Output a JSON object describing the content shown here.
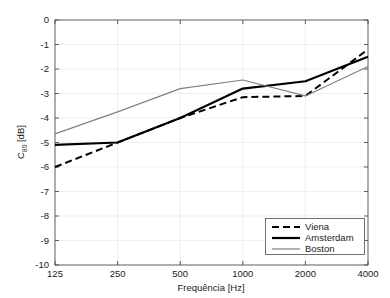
{
  "chart_data": {
    "type": "line",
    "title": "",
    "xlabel": "Frequência [Hz]",
    "ylabel": "C80 [dB]",
    "ylabel_base": "C",
    "ylabel_sub": "80",
    "ylabel_unit": " [dB]",
    "categories": [
      "125",
      "250",
      "500",
      "1000",
      "2000",
      "4000"
    ],
    "x_tick_labels": [
      "125",
      "250",
      "500",
      "1000",
      "2000",
      "4000"
    ],
    "y_tick_labels": [
      "0",
      "-1",
      "-2",
      "-3",
      "-4",
      "-5",
      "-6",
      "-7",
      "-8",
      "-9",
      "-10"
    ],
    "y_tick_values": [
      0,
      -1,
      -2,
      -3,
      -4,
      -5,
      -6,
      -7,
      -8,
      -9,
      -10
    ],
    "ylim": [
      -10,
      0
    ],
    "xscale": "log",
    "grid": true,
    "legend_position": "lower right",
    "series": [
      {
        "name": "Viena",
        "style": "dashed",
        "color": "#000000",
        "width": 2.0,
        "values": [
          -6.0,
          -5.0,
          -4.0,
          -3.15,
          -3.1,
          -1.2
        ]
      },
      {
        "name": "Amsterdam",
        "style": "solid",
        "color": "#000000",
        "width": 2.2,
        "values": [
          -5.1,
          -5.0,
          -4.0,
          -2.8,
          -2.5,
          -1.5
        ]
      },
      {
        "name": "Boston",
        "style": "solid",
        "color": "#808080",
        "width": 1.2,
        "values": [
          -4.65,
          -3.75,
          -2.8,
          -2.45,
          -3.1,
          -1.9
        ]
      }
    ]
  },
  "legend": {
    "entries": [
      {
        "label": "Viena"
      },
      {
        "label": "Amsterdam"
      },
      {
        "label": "Boston"
      }
    ]
  },
  "colors": {
    "axis": "#4d4d4d",
    "grid": "#e8e8e8",
    "text": "#1a1a1a",
    "background": "#ffffff",
    "series_dark": "#000000",
    "series_gray": "#808080"
  }
}
